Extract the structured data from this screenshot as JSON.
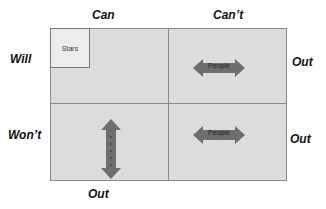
{
  "columns": [
    {
      "label": "Can"
    },
    {
      "label": "Can’t"
    }
  ],
  "rows": [
    {
      "label": "Will"
    },
    {
      "label": "Won’t"
    }
  ],
  "out_labels": {
    "right_top": "Out",
    "right_bottom": "Out",
    "bottom": "Out"
  },
  "cells": {
    "will_can": {
      "box_label": "Stars"
    },
    "will_cant": {
      "arrow_label": "People",
      "arrow_direction": "horizontal"
    },
    "wont_can": {
      "arrow_label": "People",
      "arrow_direction": "vertical"
    },
    "wont_cant": {
      "arrow_label": "People",
      "arrow_direction": "horizontal"
    }
  },
  "colors": {
    "grid_fill": "#dcdcdc",
    "arrow_fill": "#6e6e6e",
    "border": "#8a8a8a"
  }
}
